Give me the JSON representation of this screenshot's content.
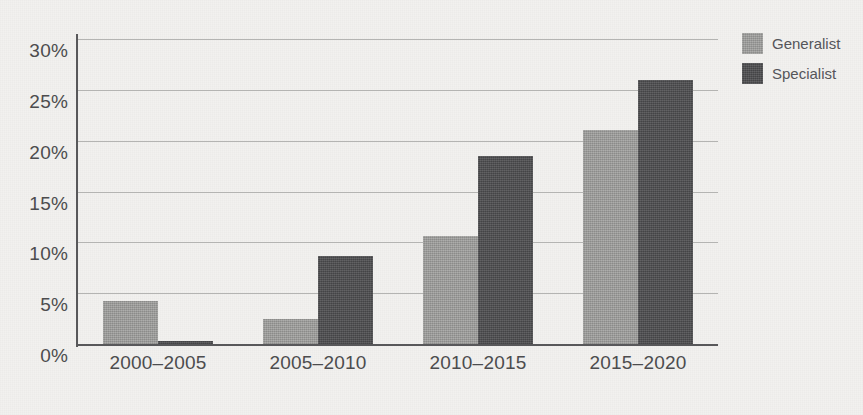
{
  "chart_data": {
    "type": "bar",
    "title": "",
    "subtitle": "",
    "xlabel": "",
    "ylabel": "",
    "categories": [
      "2000–2005",
      "2005–2010",
      "2010–2015",
      "2015–2020"
    ],
    "series": [
      {
        "name": "Generalist",
        "color": "#9c9c9a",
        "values": [
          4.3,
          2.6,
          10.7,
          21.1
        ]
      },
      {
        "name": "Specialist",
        "color": "#4d4d4f",
        "values": [
          0.4,
          8.8,
          18.6,
          26.1
        ]
      }
    ],
    "ylim": [
      0,
      30
    ],
    "yticks": [
      0,
      5,
      10,
      15,
      20,
      25,
      30
    ],
    "ytick_labels": [
      "0%",
      "5%",
      "10%",
      "15%",
      "20%",
      "25%",
      "30%"
    ],
    "value_suffix": "%",
    "grid": true,
    "grid_axis": "y",
    "legend_position": "top-right",
    "legend": [
      {
        "label": "Generalist",
        "color": "#9c9c9a"
      },
      {
        "label": "Specialist",
        "color": "#4d4d4f"
      }
    ],
    "background_color": "#f2f1ef",
    "axis_color": "#58585a",
    "grid_color": "#b4b4b2",
    "text_color": "#4c4c4e"
  }
}
